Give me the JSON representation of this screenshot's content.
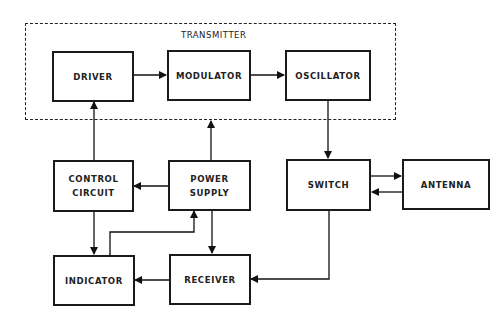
{
  "diagram": {
    "group": {
      "label": "TRANSMITTER"
    },
    "blocks": [
      {
        "id": "driver",
        "label": "DRIVER"
      },
      {
        "id": "modulator",
        "label": "MODULATOR"
      },
      {
        "id": "oscillator",
        "label": "OSCILLATOR"
      },
      {
        "id": "control_circuit",
        "label": "CONTROL\nCIRCUIT"
      },
      {
        "id": "power_supply",
        "label": "POWER\nSUPPLY"
      },
      {
        "id": "switch",
        "label": "SWITCH"
      },
      {
        "id": "antenna",
        "label": "ANTENNA"
      },
      {
        "id": "indicator",
        "label": "INDICATOR"
      },
      {
        "id": "receiver",
        "label": "RECEIVER"
      }
    ],
    "connections": [
      {
        "from": "driver",
        "to": "modulator"
      },
      {
        "from": "modulator",
        "to": "oscillator"
      },
      {
        "from": "oscillator",
        "to": "switch"
      },
      {
        "from": "switch",
        "to": "antenna"
      },
      {
        "from": "antenna",
        "to": "switch"
      },
      {
        "from": "switch",
        "to": "receiver"
      },
      {
        "from": "receiver",
        "to": "indicator"
      },
      {
        "from": "power_supply",
        "to": "control_circuit"
      },
      {
        "from": "power_supply",
        "to": "receiver"
      },
      {
        "from": "power_supply",
        "to": "transmitter"
      },
      {
        "from": "control_circuit",
        "to": "driver"
      },
      {
        "from": "control_circuit",
        "to": "indicator"
      },
      {
        "from": "indicator",
        "to": "power_supply",
        "bidirectional": true
      }
    ]
  }
}
